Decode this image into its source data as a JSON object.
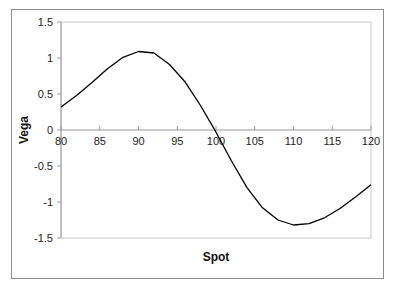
{
  "chart_data": {
    "type": "line",
    "title": "",
    "xlabel": "Spot",
    "ylabel": "Vega",
    "xlim": [
      80,
      120
    ],
    "ylim": [
      -1.5,
      1.5
    ],
    "x_ticks": [
      80,
      85,
      90,
      95,
      100,
      105,
      110,
      115,
      120
    ],
    "y_ticks": [
      1.5,
      1,
      0.5,
      0,
      -0.5,
      -1,
      -1.5
    ],
    "x_tick_labels": [
      "80",
      "85",
      "90",
      "95",
      "100",
      "105",
      "110",
      "115",
      "120"
    ],
    "y_tick_labels": [
      "1.5",
      "1",
      "0.5",
      "0",
      "-0.5",
      "-1",
      "-1.5"
    ],
    "grid": false,
    "legend": null,
    "series": [
      {
        "name": "Vega",
        "color": "#000000",
        "x": [
          80,
          82,
          84,
          86,
          88,
          90,
          92,
          94,
          96,
          98,
          100,
          102,
          104,
          106,
          108,
          110,
          112,
          114,
          116,
          118,
          120
        ],
        "values": [
          0.32,
          0.48,
          0.66,
          0.85,
          1.01,
          1.09,
          1.07,
          0.91,
          0.67,
          0.34,
          -0.03,
          -0.43,
          -0.8,
          -1.08,
          -1.25,
          -1.32,
          -1.3,
          -1.22,
          -1.09,
          -0.93,
          -0.76
        ]
      }
    ]
  }
}
